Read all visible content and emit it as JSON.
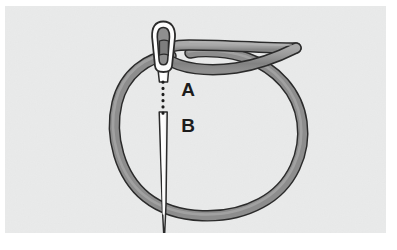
{
  "figure": {
    "panel": {
      "background_color": "#e9eaea",
      "x": 5,
      "y": 6,
      "width": 381,
      "height": 227
    },
    "page_background_color": "#ffffff"
  },
  "labels": [
    {
      "id": "A",
      "text": "A",
      "x": 188,
      "y": 90
    },
    {
      "id": "B",
      "text": "B",
      "x": 188,
      "y": 126
    }
  ],
  "objects": {
    "needle": {
      "name": "sewing-needle",
      "fill_color": "#fdfdfd",
      "stroke_color": "#2b2b2b",
      "eye_fill_color": "#9b9b9b",
      "head_top_y": 22,
      "tip_y": 243,
      "shaft_x": 163
    },
    "thread": {
      "name": "thread-loop",
      "fill_color": "#8d8d8d",
      "stroke_color": "#2b2b2b",
      "highlight_color": "#b9b9b9",
      "thickness": 9,
      "tail_end_x": 296,
      "tail_end_y": 48
    },
    "dotted_guide": {
      "name": "dotted-guide-line",
      "color": "#1c1c1c",
      "x": 163,
      "y_start": 82,
      "y_end": 118,
      "dot_count": 7
    }
  },
  "chart_data": {
    "type": "diagram",
    "annotations": [
      "A",
      "B"
    ]
  }
}
